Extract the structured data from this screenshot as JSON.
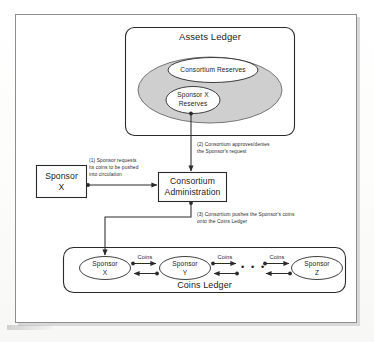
{
  "figure": {
    "assets_ledger": {
      "title": "Assets Ledger",
      "consortium_reserves": "Consortium Reserves",
      "sponsor_x_reserves_line1": "Sponsor X",
      "sponsor_x_reserves_line2": "Reserves"
    },
    "sponsor_box": {
      "line1": "Sponsor",
      "line2": "X"
    },
    "consortium_admin": {
      "line1": "Consortium",
      "line2": "Administration"
    },
    "coins_ledger": {
      "title": "Coins Ledger",
      "nodes": [
        {
          "line1": "Sponsor",
          "line2": "X"
        },
        {
          "line1": "Sponsor",
          "line2": "Y"
        },
        {
          "line1": "Sponsor",
          "line2": "Z"
        }
      ],
      "edge_labels": [
        "Coins",
        "Coins",
        "Coins"
      ],
      "ellipsis": "• • •"
    },
    "annotations": [
      {
        "id": "1",
        "line1": "(1) Sponsor requests",
        "line2": "its coins to be pushed",
        "line3": "into circulation"
      },
      {
        "id": "2",
        "line1": "(2) Consortium approves/denies",
        "line2": "the Sponsor's request"
      },
      {
        "id": "3",
        "line1": "(3) Consortium pushes the Sponsor's coins",
        "line2": "onto the Coins Ledger"
      }
    ]
  },
  "colors": {
    "line": "#2a2a2a",
    "frame": "#8d8d8d",
    "ellipse_fill": "#cfcfcf",
    "page": "#ffffff"
  }
}
